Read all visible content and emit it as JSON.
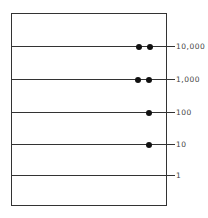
{
  "diagram": {
    "levels": [
      {
        "label": "10,000",
        "y": 46,
        "dots": [
          139,
          150
        ]
      },
      {
        "label": "1,000",
        "y": 79,
        "dots": [
          138,
          149
        ]
      },
      {
        "label": "100",
        "y": 112,
        "dots": [
          149
        ]
      },
      {
        "label": "10",
        "y": 144,
        "dots": [
          149
        ]
      },
      {
        "label": "1",
        "y": 175,
        "dots": []
      }
    ]
  }
}
